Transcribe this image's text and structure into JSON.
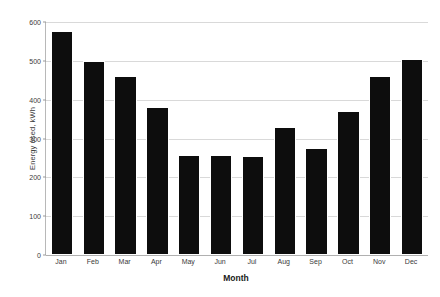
{
  "chart_data": {
    "type": "bar",
    "title": "",
    "xlabel": "Month",
    "ylabel": "Energy used, kWh",
    "categories": [
      "Jan",
      "Feb",
      "Mar",
      "Apr",
      "May",
      "Jun",
      "Jul",
      "Aug",
      "Sep",
      "Oct",
      "Nov",
      "Dec"
    ],
    "values": [
      578,
      500,
      462,
      382,
      258,
      257,
      255,
      330,
      276,
      372,
      462,
      504
    ],
    "series": [
      {
        "name": "Energy used",
        "values": [
          578,
          500,
          462,
          382,
          258,
          257,
          255,
          330,
          276,
          372,
          462,
          504
        ]
      }
    ],
    "ylim": [
      0,
      600
    ],
    "y_ticks": [
      0,
      100,
      200,
      300,
      400,
      500,
      600
    ],
    "y_tick_labels": [
      "0",
      "100",
      "200",
      "300",
      "400",
      "500",
      "600"
    ],
    "grid": true,
    "legend": false,
    "legend_position": "none",
    "bar_color": "#0d0d0d",
    "gridline_color": "#d9d9d9",
    "axis_color": "#b8b8b8",
    "background_color": "#ffffff"
  }
}
